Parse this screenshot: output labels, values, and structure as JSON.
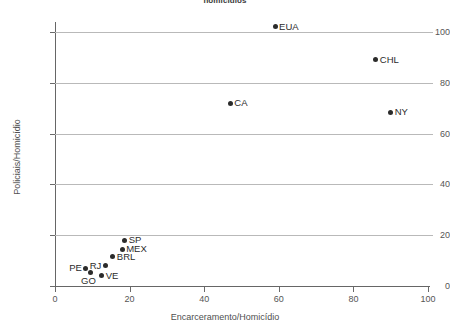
{
  "chart_data": {
    "type": "scatter",
    "title": "homicídios",
    "xlabel": "Encarceramento/Homicídio",
    "ylabel": "Policiais/Homicídio",
    "xlim": [
      0,
      100
    ],
    "ylim": [
      0,
      104
    ],
    "xticks": [
      0,
      20,
      40,
      60,
      80,
      100
    ],
    "yticks": [
      0,
      20,
      40,
      60,
      80,
      100
    ],
    "grid": true,
    "legend": "none",
    "marker_color": "#2b2b2b",
    "points": [
      {
        "label": "EUA",
        "x": 59.0,
        "y": 102.0,
        "label_side": "right"
      },
      {
        "label": "CHL",
        "x": 86.0,
        "y": 89.0,
        "label_side": "right"
      },
      {
        "label": "CA",
        "x": 47.0,
        "y": 72.0,
        "label_side": "right"
      },
      {
        "label": "NY",
        "x": 90.0,
        "y": 68.5,
        "label_side": "right"
      },
      {
        "label": "SP",
        "x": 18.7,
        "y": 18.0,
        "label_side": "right"
      },
      {
        "label": "MEX",
        "x": 18.0,
        "y": 14.5,
        "label_side": "right"
      },
      {
        "label": "BRL",
        "x": 15.5,
        "y": 11.5,
        "label_side": "right"
      },
      {
        "label": "RJ",
        "x": 13.5,
        "y": 8.0,
        "label_side": "left"
      },
      {
        "label": "VE",
        "x": 12.5,
        "y": 4.0,
        "label_side": "right"
      },
      {
        "label": "PE",
        "x": 8.3,
        "y": 7.0,
        "label_side": "left"
      },
      {
        "label": "GO",
        "x": 9.4,
        "y": 5.5,
        "label_side": "below"
      }
    ]
  }
}
